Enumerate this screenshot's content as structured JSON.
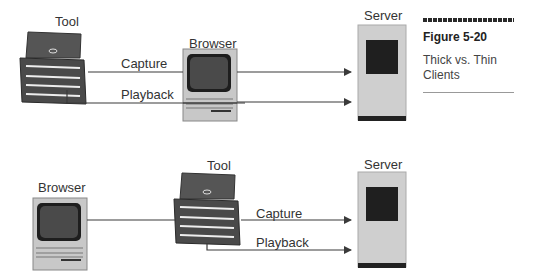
{
  "caption": {
    "figure_number": "Figure 5-20",
    "title": "Thick vs. Thin Clients"
  },
  "top_diagram": {
    "tool_label": "Tool",
    "browser_label": "Browser",
    "server_label": "Server",
    "capture_label": "Capture",
    "playback_label": "Playback"
  },
  "bottom_diagram": {
    "browser_label": "Browser",
    "tool_label": "Tool",
    "server_label": "Server",
    "capture_label": "Capture",
    "playback_label": "Playback"
  },
  "colors": {
    "toolbox": "#4a4a4a",
    "computer_body": "#c8c8c8",
    "server_body": "#cfcfcf",
    "screen": "#2b2b2b",
    "line": "#3a3a3a"
  }
}
